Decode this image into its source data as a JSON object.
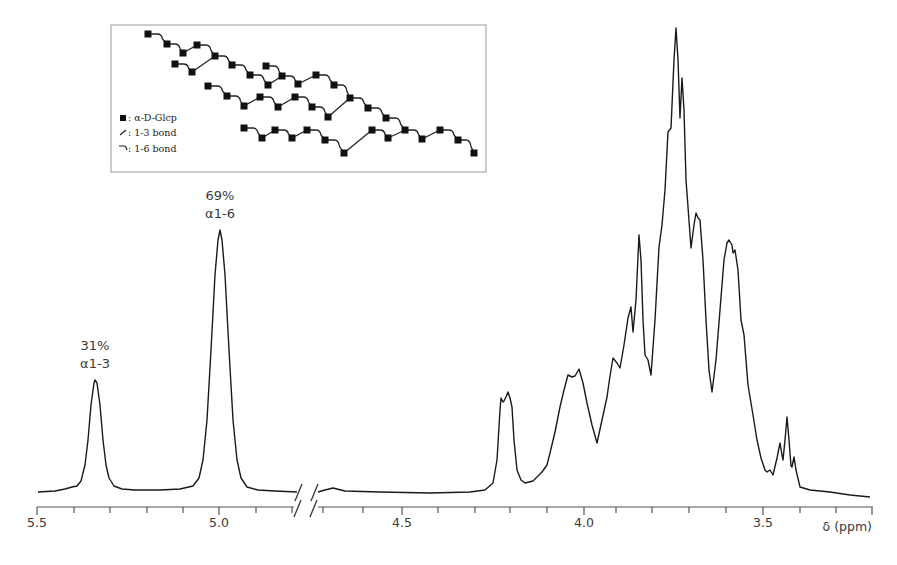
{
  "chart_data": {
    "type": "line",
    "title": "",
    "xlabel": "δ (ppm)",
    "ylabel": "",
    "x_axis": {
      "reversed": true,
      "broken": true,
      "break_between_ppm": [
        4.78,
        4.73
      ],
      "segments": [
        {
          "from": 5.5,
          "to": 4.78
        },
        {
          "from": 4.73,
          "to": 3.35
        }
      ],
      "ticks_major": [
        {
          "value": 5.5,
          "label": "5.5"
        },
        {
          "value": 5.0,
          "label": "5.0"
        },
        {
          "value": 4.5,
          "label": "4.5"
        },
        {
          "value": 4.0,
          "label": "4.0"
        },
        {
          "value": 3.5,
          "label": "3.5"
        }
      ],
      "minor_tick_step": 0.05
    },
    "grid": false,
    "annotations": [
      {
        "id": "a13",
        "percent": "31%",
        "linkage": "α1-3",
        "ppm": 5.34,
        "rel_height": 0.24
      },
      {
        "id": "a16",
        "percent": "69%",
        "linkage": "α1-6",
        "ppm": 4.99,
        "rel_height": 0.55
      }
    ],
    "peaks": [
      {
        "ppm": 5.34,
        "rel_height": 0.24,
        "label": "α1-3 anomeric"
      },
      {
        "ppm": 4.99,
        "rel_height": 0.55,
        "label": "α1-6 anomeric"
      },
      {
        "ppm": 4.22,
        "rel_height": 0.21
      },
      {
        "ppm": 4.02,
        "rel_height": 0.26
      },
      {
        "ppm": 3.92,
        "rel_height": 0.28
      },
      {
        "ppm": 3.87,
        "rel_height": 0.4
      },
      {
        "ppm": 3.85,
        "rel_height": 0.55
      },
      {
        "ppm": 3.75,
        "rel_height": 1.0
      },
      {
        "ppm": 3.73,
        "rel_height": 0.89
      },
      {
        "ppm": 3.69,
        "rel_height": 0.6
      },
      {
        "ppm": 3.6,
        "rel_height": 0.55
      },
      {
        "ppm": 3.42,
        "rel_height": 0.15
      },
      {
        "ppm": 3.4,
        "rel_height": 0.17
      }
    ],
    "series": [
      {
        "name": "1H NMR spectrum (left segment)",
        "points_px": [
          [
            38,
            492
          ],
          [
            55,
            491
          ],
          [
            65,
            489
          ],
          [
            72,
            487
          ],
          [
            77,
            486
          ],
          [
            81,
            481
          ],
          [
            85,
            465
          ],
          [
            88,
            440
          ],
          [
            91,
            405
          ],
          [
            94,
            383
          ],
          [
            95,
            380
          ],
          [
            97,
            383
          ],
          [
            100,
            405
          ],
          [
            103,
            440
          ],
          [
            106,
            465
          ],
          [
            109,
            478
          ],
          [
            114,
            486
          ],
          [
            122,
            489
          ],
          [
            135,
            490
          ],
          [
            160,
            490
          ],
          [
            180,
            489
          ],
          [
            193,
            486
          ],
          [
            199,
            478
          ],
          [
            203,
            460
          ],
          [
            207,
            420
          ],
          [
            211,
            350
          ],
          [
            215,
            275
          ],
          [
            218,
            240
          ],
          [
            220,
            230
          ],
          [
            222,
            240
          ],
          [
            225,
            275
          ],
          [
            229,
            350
          ],
          [
            233,
            420
          ],
          [
            237,
            460
          ],
          [
            241,
            478
          ],
          [
            247,
            487
          ],
          [
            258,
            490
          ],
          [
            275,
            491
          ],
          [
            297,
            492
          ]
        ]
      },
      {
        "name": "1H NMR spectrum (right segment)",
        "points_px": [
          [
            318,
            492
          ],
          [
            325,
            490
          ],
          [
            333,
            488
          ],
          [
            345,
            491
          ],
          [
            380,
            492
          ],
          [
            430,
            493
          ],
          [
            470,
            492
          ],
          [
            485,
            490
          ],
          [
            493,
            483
          ],
          [
            497,
            460
          ],
          [
            500,
            410
          ],
          [
            501,
            398
          ],
          [
            503,
            402
          ],
          [
            504,
            401
          ],
          [
            506,
            397
          ],
          [
            508,
            392
          ],
          [
            510,
            398
          ],
          [
            512,
            407
          ],
          [
            514,
            440
          ],
          [
            517,
            470
          ],
          [
            521,
            480
          ],
          [
            525,
            483
          ],
          [
            533,
            481
          ],
          [
            542,
            472
          ],
          [
            547,
            465
          ],
          [
            550,
            453
          ],
          [
            555,
            432
          ],
          [
            560,
            407
          ],
          [
            564,
            390
          ],
          [
            568,
            375
          ],
          [
            572,
            377
          ],
          [
            575,
            376
          ],
          [
            579,
            369
          ],
          [
            583,
            383
          ],
          [
            587,
            403
          ],
          [
            592,
            425
          ],
          [
            597,
            443
          ],
          [
            602,
            420
          ],
          [
            607,
            397
          ],
          [
            610,
            376
          ],
          [
            613,
            358
          ],
          [
            617,
            363
          ],
          [
            620,
            368
          ],
          [
            624,
            345
          ],
          [
            628,
            318
          ],
          [
            631,
            307
          ],
          [
            633,
            332
          ],
          [
            636,
            300
          ],
          [
            639,
            235
          ],
          [
            641,
            260
          ],
          [
            643,
            320
          ],
          [
            645,
            355
          ],
          [
            648,
            360
          ],
          [
            651,
            375
          ],
          [
            655,
            320
          ],
          [
            659,
            247
          ],
          [
            662,
            225
          ],
          [
            665,
            190
          ],
          [
            668,
            132
          ],
          [
            671,
            128
          ],
          [
            674,
            60
          ],
          [
            676,
            28
          ],
          [
            678,
            60
          ],
          [
            680,
            118
          ],
          [
            682,
            78
          ],
          [
            684,
            110
          ],
          [
            686,
            180
          ],
          [
            688,
            207
          ],
          [
            691,
            248
          ],
          [
            694,
            225
          ],
          [
            696,
            213
          ],
          [
            698,
            218
          ],
          [
            700,
            220
          ],
          [
            703,
            260
          ],
          [
            706,
            320
          ],
          [
            709,
            370
          ],
          [
            712,
            392
          ],
          [
            716,
            360
          ],
          [
            720,
            310
          ],
          [
            724,
            260
          ],
          [
            727,
            243
          ],
          [
            729,
            240
          ],
          [
            732,
            245
          ],
          [
            733,
            253
          ],
          [
            735,
            250
          ],
          [
            738,
            270
          ],
          [
            741,
            320
          ],
          [
            744,
            335
          ],
          [
            748,
            385
          ],
          [
            753,
            415
          ],
          [
            757,
            440
          ],
          [
            761,
            458
          ],
          [
            765,
            470
          ],
          [
            767,
            472
          ],
          [
            770,
            470
          ],
          [
            773,
            475
          ],
          [
            777,
            458
          ],
          [
            780,
            443
          ],
          [
            782,
            455
          ],
          [
            783,
            460
          ],
          [
            785,
            440
          ],
          [
            787,
            417
          ],
          [
            789,
            440
          ],
          [
            791,
            466
          ],
          [
            792,
            467
          ],
          [
            794,
            457
          ],
          [
            796,
            470
          ],
          [
            800,
            487
          ],
          [
            810,
            490
          ],
          [
            830,
            492
          ],
          [
            850,
            495
          ],
          [
            870,
            497
          ]
        ]
      }
    ]
  },
  "inset": {
    "legend": [
      {
        "symbol": "square",
        "label": ": α-D-Glcp"
      },
      {
        "symbol": "slash",
        "label": ": 1-3 bond"
      },
      {
        "symbol": "hook",
        "label": ": 1-6 bond"
      }
    ],
    "residue_count": 40
  },
  "colors": {
    "trace": "#1a1a1a",
    "axis": "#555555",
    "text": "#3a3a3a",
    "inset_border": "#9a9a9a",
    "residue": "#111111"
  }
}
